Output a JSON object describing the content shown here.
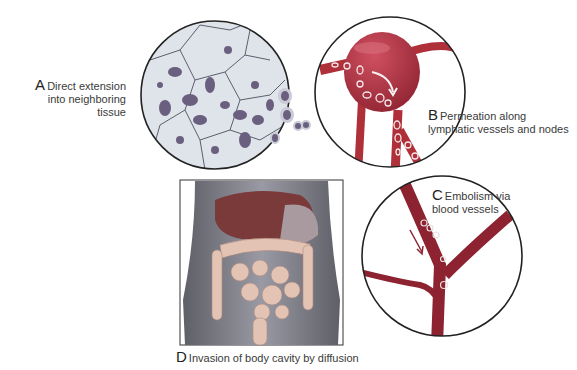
{
  "diagram": {
    "panels": [
      {
        "id": "A",
        "letter": "A",
        "text_line1": "Direct extension",
        "text_line2": "into neighboring tissue"
      },
      {
        "id": "B",
        "letter": "B",
        "text_line1": "Permeation along",
        "text_line2": "lymphatic vessels and nodes"
      },
      {
        "id": "C",
        "letter": "C",
        "text_line1": "Embolism via",
        "text_line2": "blood vessels"
      },
      {
        "id": "D",
        "letter": "D",
        "text_line1": "Invasion of body cavity by diffusion"
      }
    ],
    "colors": {
      "cell_fill": "#dfe3ea",
      "cell_border": "#5b5f6e",
      "nucleus": "#6b5f80",
      "vessel": "#b0303a",
      "vessel_dark": "#8d2230",
      "body": "#8a8a94",
      "liver": "#7a3a3a",
      "intestine": "#e3c3b3"
    }
  }
}
